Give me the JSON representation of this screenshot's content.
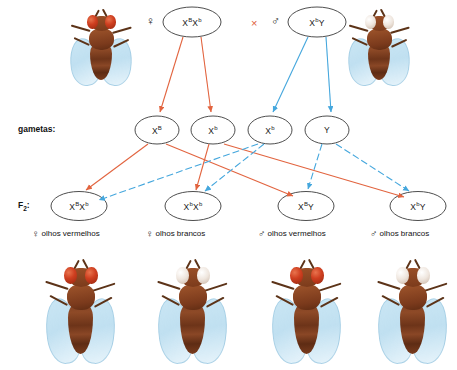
{
  "row_labels": {
    "gametes": "gametas:",
    "f2_prefix": "F",
    "f2_sub": "2",
    "f2_suffix": ":"
  },
  "symbols": {
    "female": "♀",
    "male": "♂",
    "cross": "×"
  },
  "colors": {
    "female_arrow": "#e2643f",
    "male_arrow": "#45a7dd",
    "circle_stroke": "#3a3a3a",
    "text": "#111111",
    "red_eye": "#cf3f20",
    "white_eye": "#f2ece6"
  },
  "parents": [
    {
      "id": "parent-female",
      "sex": "♀",
      "genotype_base1": "X",
      "genotype_sup1": "B",
      "genotype_base2": "X",
      "genotype_sup2": "b",
      "genotype_text": "Xᴮ Xᵇ",
      "phenotype": "olhos vermelhos",
      "eye_color": "red"
    },
    {
      "id": "parent-male",
      "sex": "♂",
      "genotype_base1": "X",
      "genotype_sup1": "b",
      "genotype_base2": "Y",
      "genotype_sup2": "",
      "genotype_text": "Xᵇ Y",
      "phenotype": "olhos brancos",
      "eye_color": "white"
    }
  ],
  "gametes": [
    {
      "id": "gamete-XB",
      "base": "X",
      "sup": "B",
      "origin": "female"
    },
    {
      "id": "gamete-Xb-fem",
      "base": "X",
      "sup": "b",
      "origin": "female"
    },
    {
      "id": "gamete-Xb-male",
      "base": "X",
      "sup": "b",
      "origin": "male"
    },
    {
      "id": "gamete-Y",
      "base": "Y",
      "sup": "",
      "origin": "male"
    }
  ],
  "f2": [
    {
      "id": "f2-female-red",
      "base1": "X",
      "sup1": "B",
      "base2": "X",
      "sup2": "b",
      "sex": "♀",
      "phenotype": "olhos vermelhos",
      "eye_color": "red"
    },
    {
      "id": "f2-female-white",
      "base1": "X",
      "sup1": "b",
      "base2": "X",
      "sup2": "b",
      "sex": "♀",
      "phenotype": "olhos brancos",
      "eye_color": "white"
    },
    {
      "id": "f2-male-red",
      "base1": "X",
      "sup1": "B",
      "base2": "Y",
      "sup2": "",
      "sex": "♂",
      "phenotype": "olhos vermelhos",
      "eye_color": "red"
    },
    {
      "id": "f2-male-white",
      "base1": "X",
      "sup1": "b",
      "base2": "Y",
      "sup2": "",
      "sex": "♂",
      "phenotype": "olhos brancos",
      "eye_color": "white"
    }
  ],
  "flies": {
    "top_left": {
      "eye_color": "red"
    },
    "top_right": {
      "eye_color": "white"
    },
    "bottom": [
      {
        "eye_color": "red"
      },
      {
        "eye_color": "white"
      },
      {
        "eye_color": "red"
      },
      {
        "eye_color": "white"
      }
    ]
  }
}
